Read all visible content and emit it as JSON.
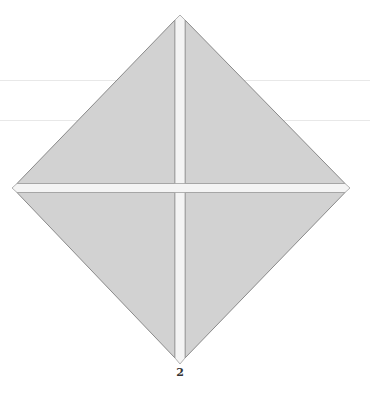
{
  "diagram": {
    "type": "origami-fold-step",
    "step_label": "2",
    "shape": "square rotated 45° (diamond) divided into four triangular quadrants by white crease bands",
    "colors": {
      "fill": "#d2d2d2",
      "outline": "#8a8a8a",
      "crease": "#f4f4f4",
      "background": "#ffffff",
      "scanline": "#e8e8e8"
    },
    "vertices": {
      "top": [
        180,
        15
      ],
      "left": [
        12,
        188
      ],
      "right": [
        350,
        188
      ],
      "bottom": [
        180,
        364
      ]
    },
    "creases": {
      "vertical": {
        "x": 180,
        "width": 10
      },
      "horizontal": {
        "y": 188,
        "width": 9
      }
    }
  }
}
